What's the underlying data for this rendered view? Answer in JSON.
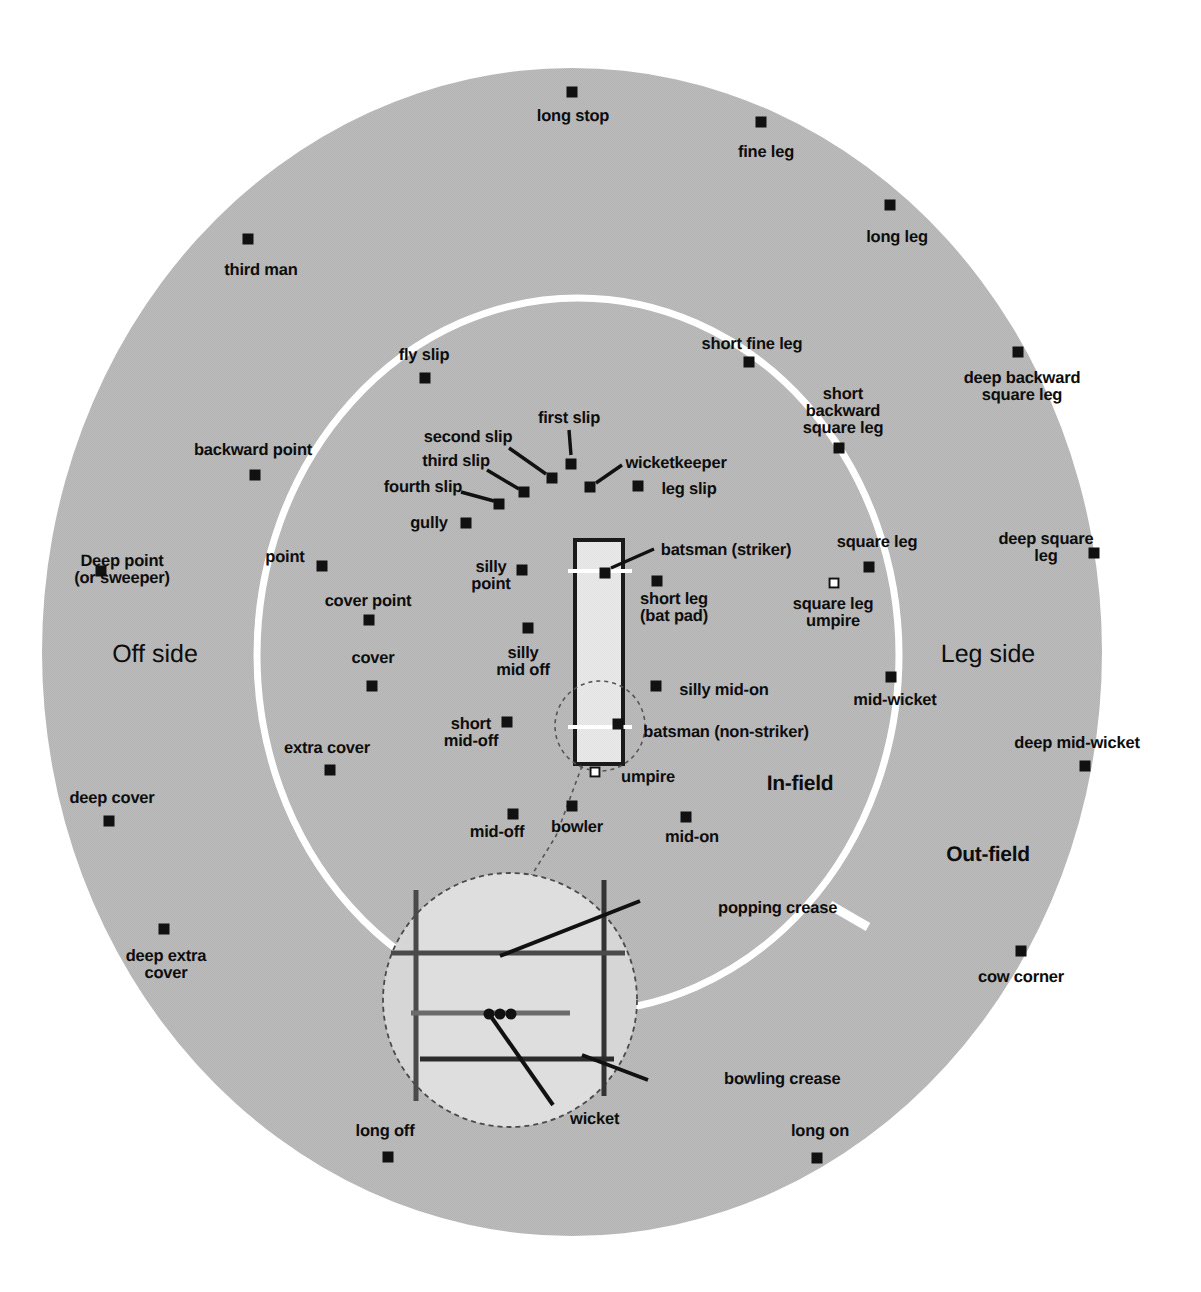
{
  "diagram": {
    "type": "cricket-field-diagram",
    "colors": {
      "outfield_gray": "#b9b9b9",
      "infield_gray": "#b9b9b9",
      "boundary_white": "#ffffff",
      "pitch_fill": "#e6e6e6",
      "marker_black": "#111111",
      "label_black": "#0d0d0d"
    },
    "zones": [
      {
        "name": "off-side",
        "label": "Off side",
        "x": 155,
        "y": 655
      },
      {
        "name": "leg-side",
        "label": "Leg side",
        "x": 988,
        "y": 655
      },
      {
        "name": "in-field",
        "label": "In-field",
        "x": 800,
        "y": 784
      },
      {
        "name": "out-field",
        "label": "Out-field",
        "x": 988,
        "y": 855
      }
    ],
    "pitch": {
      "name": "pitch",
      "striker_label": "batsman (striker)",
      "nonstriker_label": "batsman (non-striker)",
      "umpire_label": "umpire",
      "bowler_label": "bowler"
    },
    "crease_inset": {
      "name": "crease-detail-inset",
      "callouts": [
        {
          "name": "popping-crease",
          "label": "popping crease",
          "x": 718,
          "y": 908
        },
        {
          "name": "bowling-crease",
          "label": "bowling crease",
          "x": 724,
          "y": 1079
        },
        {
          "name": "wicket",
          "label": "wicket",
          "x": 570,
          "y": 1119
        }
      ]
    },
    "fielders": [
      {
        "name": "long-stop",
        "label": "long stop",
        "dot_x": 572,
        "dot_y": 92,
        "lx": 573,
        "ly": 116,
        "align": "c"
      },
      {
        "name": "fine-leg",
        "label": "fine leg",
        "dot_x": 761,
        "dot_y": 122,
        "lx": 766,
        "ly": 152,
        "align": "c"
      },
      {
        "name": "long-leg",
        "label": "long leg",
        "dot_x": 890,
        "dot_y": 205,
        "lx": 897,
        "ly": 237,
        "align": "c"
      },
      {
        "name": "third-man",
        "label": "third man",
        "dot_x": 248,
        "dot_y": 239,
        "lx": 261,
        "ly": 270,
        "align": "c"
      },
      {
        "name": "short-fine-leg",
        "label": "short fine leg",
        "dot_x": 749,
        "dot_y": 362,
        "lx": 752,
        "ly": 344,
        "align": "c"
      },
      {
        "name": "deep-backward-square-leg",
        "label": "deep backward\nsquare leg",
        "dot_x": 1018,
        "dot_y": 352,
        "lx": 1022,
        "ly": 387,
        "align": "c"
      },
      {
        "name": "fly-slip",
        "label": "fly slip",
        "dot_x": 425,
        "dot_y": 378,
        "lx": 424,
        "ly": 355,
        "align": "c"
      },
      {
        "name": "short-backward-square-leg",
        "label": "short\nbackward\nsquare leg",
        "dot_x": 839,
        "dot_y": 448,
        "lx": 843,
        "ly": 411,
        "align": "c"
      },
      {
        "name": "first-slip",
        "label": "first slip",
        "dot_x": 571,
        "dot_y": 464,
        "lx": 569,
        "ly": 418,
        "align": "c"
      },
      {
        "name": "second-slip",
        "label": "second slip",
        "dot_x": 552,
        "dot_y": 478,
        "lx": 468,
        "ly": 437,
        "align": "c"
      },
      {
        "name": "third-slip",
        "label": "third slip",
        "dot_x": 524,
        "dot_y": 492,
        "lx": 456,
        "ly": 461,
        "align": "c"
      },
      {
        "name": "fourth-slip",
        "label": "fourth slip",
        "dot_x": 499,
        "dot_y": 504,
        "lx": 423,
        "ly": 487,
        "align": "c"
      },
      {
        "name": "wicketkeeper",
        "label": "wicketkeeper",
        "dot_x": 590,
        "dot_y": 487,
        "lx": 676,
        "ly": 463,
        "align": "c"
      },
      {
        "name": "leg-slip",
        "label": "leg slip",
        "dot_x": 638,
        "dot_y": 486,
        "lx": 689,
        "ly": 489,
        "align": "c"
      },
      {
        "name": "backward-point",
        "label": "backward point",
        "dot_x": 255,
        "dot_y": 475,
        "lx": 253,
        "ly": 450,
        "align": "c"
      },
      {
        "name": "gully",
        "label": "gully",
        "dot_x": 466,
        "dot_y": 523,
        "lx": 429,
        "ly": 523,
        "align": "c"
      },
      {
        "name": "square-leg",
        "label": "square leg",
        "dot_x": 869,
        "dot_y": 567,
        "lx": 877,
        "ly": 542,
        "align": "c"
      },
      {
        "name": "deep-square-leg",
        "label": "deep square\nleg",
        "dot_x": 1094,
        "dot_y": 553,
        "lx": 1046,
        "ly": 548,
        "align": "c"
      },
      {
        "name": "deep-point-or-sweeper",
        "label": "Deep point\n(or sweeper)",
        "dot_x": 101,
        "dot_y": 571,
        "lx": 122,
        "ly": 570,
        "align": "c"
      },
      {
        "name": "point",
        "label": "point",
        "dot_x": 322,
        "dot_y": 566,
        "lx": 285,
        "ly": 557,
        "align": "c"
      },
      {
        "name": "silly-point",
        "label": "silly\npoint",
        "dot_x": 522,
        "dot_y": 570,
        "lx": 491,
        "ly": 576,
        "align": "c"
      },
      {
        "name": "batsman-striker",
        "label": "batsman (striker)",
        "dot_x": 605,
        "dot_y": 573,
        "lx": 726,
        "ly": 550,
        "align": "c"
      },
      {
        "name": "short-leg-bat-pad",
        "label": "short leg\n(bat pad)",
        "dot_x": 657,
        "dot_y": 581,
        "lx": 674,
        "ly": 608,
        "align": "c"
      },
      {
        "name": "square-leg-umpire",
        "label": "square leg\numpire",
        "dot_x": 834,
        "dot_y": 583,
        "lx": 833,
        "ly": 613,
        "align": "c",
        "hollow": true
      },
      {
        "name": "cover-point",
        "label": "cover point",
        "dot_x": 369,
        "dot_y": 620,
        "lx": 368,
        "ly": 601,
        "align": "c"
      },
      {
        "name": "silly-mid-off",
        "label": "silly\nmid off",
        "dot_x": 528,
        "dot_y": 628,
        "lx": 523,
        "ly": 662,
        "align": "c"
      },
      {
        "name": "cover",
        "label": "cover",
        "dot_x": 372,
        "dot_y": 686,
        "lx": 373,
        "ly": 658,
        "align": "c"
      },
      {
        "name": "silly-mid-on",
        "label": "silly mid-on",
        "dot_x": 656,
        "dot_y": 686,
        "lx": 724,
        "ly": 690,
        "align": "c"
      },
      {
        "name": "mid-wicket",
        "label": "mid-wicket",
        "dot_x": 891,
        "dot_y": 677,
        "lx": 895,
        "ly": 700,
        "align": "c"
      },
      {
        "name": "short-mid-off",
        "label": "short\nmid-off",
        "dot_x": 507,
        "dot_y": 722,
        "lx": 471,
        "ly": 733,
        "align": "c"
      },
      {
        "name": "batsman-non-striker",
        "label": "batsman (non-striker)",
        "dot_x": 618,
        "dot_y": 724,
        "lx": 726,
        "ly": 732,
        "align": "c"
      },
      {
        "name": "extra-cover",
        "label": "extra cover",
        "dot_x": 330,
        "dot_y": 770,
        "lx": 327,
        "ly": 748,
        "align": "c"
      },
      {
        "name": "deep-mid-wicket",
        "label": "deep mid-wicket",
        "dot_x": 1085,
        "dot_y": 766,
        "lx": 1077,
        "ly": 743,
        "align": "c"
      },
      {
        "name": "umpire",
        "label": "umpire",
        "dot_x": 595,
        "dot_y": 772,
        "lx": 648,
        "ly": 777,
        "align": "c",
        "hollow": true
      },
      {
        "name": "deep-cover",
        "label": "deep cover",
        "dot_x": 109,
        "dot_y": 821,
        "lx": 112,
        "ly": 798,
        "align": "c"
      },
      {
        "name": "bowler",
        "label": "bowler",
        "dot_x": 572,
        "dot_y": 806,
        "lx": 577,
        "ly": 827,
        "align": "c"
      },
      {
        "name": "mid-off",
        "label": "mid-off",
        "dot_x": 513,
        "dot_y": 814,
        "lx": 497,
        "ly": 832,
        "align": "c"
      },
      {
        "name": "mid-on",
        "label": "mid-on",
        "dot_x": 686,
        "dot_y": 817,
        "lx": 692,
        "ly": 837,
        "align": "c"
      },
      {
        "name": "deep-extra-cover",
        "label": "deep extra\ncover",
        "dot_x": 164,
        "dot_y": 929,
        "lx": 166,
        "ly": 965,
        "align": "c"
      },
      {
        "name": "cow-corner",
        "label": "cow corner",
        "dot_x": 1021,
        "dot_y": 951,
        "lx": 1021,
        "ly": 977,
        "align": "c"
      },
      {
        "name": "long-off",
        "label": "long off",
        "dot_x": 388,
        "dot_y": 1157,
        "lx": 385,
        "ly": 1131,
        "align": "c"
      },
      {
        "name": "long-on",
        "label": "long on",
        "dot_x": 817,
        "dot_y": 1158,
        "lx": 820,
        "ly": 1131,
        "align": "c"
      }
    ]
  }
}
